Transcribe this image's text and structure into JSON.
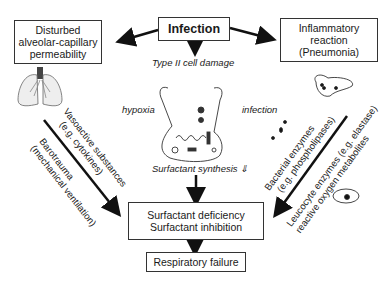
{
  "boxes": {
    "infection": "Infection",
    "disturbed": [
      "Disturbed",
      "alveolar-capillary",
      "permeability"
    ],
    "inflammatory": [
      "Inflammatory",
      "reaction",
      "(Pneumonia)"
    ],
    "deficiency": [
      "Surfactant deficiency",
      "Surfactant inhibition"
    ],
    "failure": "Respiratory failure"
  },
  "labels": {
    "type2": "Type II cell damage",
    "hypoxia": "hypoxia",
    "infection_small": "infection",
    "synthesis": "Surfactant synthesis ⇓"
  },
  "diagonal_left": {
    "vasoactive": [
      "Vasoactive substances",
      "(e.g. cytokines)"
    ],
    "barotrauma": [
      "Barotrauma",
      "(mechanical ventilation)"
    ]
  },
  "diagonal_right": {
    "bacterial": [
      "Bacterial enzymes",
      "(e.g. phospholipases)"
    ],
    "leucocyte": [
      "Leucocyte enzymes (e.g. elastase)",
      "reactive oxygen metabolites"
    ]
  },
  "icons": [
    "lungs-illustration",
    "type2-cell-illustration",
    "bacteria-cluster",
    "leucocyte-cell"
  ]
}
